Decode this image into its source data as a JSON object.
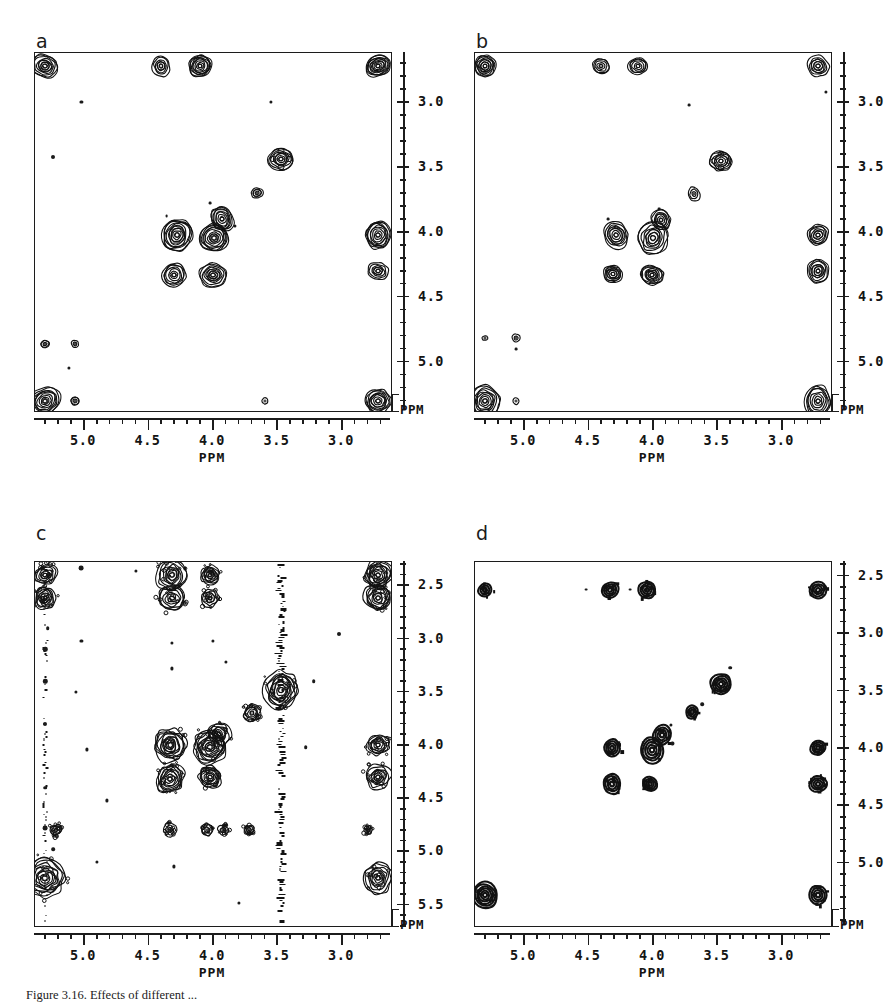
{
  "figure": {
    "caption": "Figure 3.16.  Effects of different ...",
    "axis_unit": "PPM"
  },
  "chart_data": [
    {
      "id": "a",
      "type": "heatmap",
      "subtype": "2D NMR contour spectrum",
      "label": "a",
      "title": "",
      "xlabel": "PPM",
      "ylabel": "PPM",
      "xlim": [
        5.38,
        2.62
      ],
      "ylim": [
        2.62,
        5.38
      ],
      "x_reversed": true,
      "y_reversed": true,
      "grid": false,
      "legend": "none",
      "xticks": [
        5.0,
        4.5,
        4.0,
        3.5,
        3.0
      ],
      "xticklabels": [
        "5.0",
        "4.5",
        "4.0",
        "3.5",
        "3.0"
      ],
      "yticks": [
        3.0,
        3.5,
        4.0,
        4.5,
        5.0
      ],
      "yticklabels": [
        "3.0",
        "3.5",
        "4.0",
        "4.5",
        "5.0"
      ],
      "minor_tick_subdivisions": 5,
      "peaks": [
        {
          "x": 5.3,
          "y": 2.72,
          "r": 13,
          "rings": 6,
          "style": "blob"
        },
        {
          "x": 4.4,
          "y": 2.72,
          "r": 9,
          "rings": 5,
          "style": "blob"
        },
        {
          "x": 4.1,
          "y": 2.72,
          "r": 11,
          "rings": 6,
          "style": "blob"
        },
        {
          "x": 2.72,
          "y": 2.72,
          "r": 12,
          "rings": 6,
          "style": "blob"
        },
        {
          "x": 3.47,
          "y": 3.44,
          "r": 12,
          "rings": 6,
          "style": "star"
        },
        {
          "x": 3.66,
          "y": 3.7,
          "r": 6,
          "rings": 3,
          "style": "blob"
        },
        {
          "x": 3.93,
          "y": 3.9,
          "r": 10,
          "rings": 5,
          "style": "blob"
        },
        {
          "x": 4.28,
          "y": 4.02,
          "r": 14,
          "rings": 7,
          "style": "blob"
        },
        {
          "x": 3.99,
          "y": 4.05,
          "r": 15,
          "rings": 7,
          "style": "blob"
        },
        {
          "x": 4.3,
          "y": 4.33,
          "r": 12,
          "rings": 6,
          "style": "blob"
        },
        {
          "x": 4.0,
          "y": 4.33,
          "r": 13,
          "rings": 6,
          "style": "blob"
        },
        {
          "x": 2.72,
          "y": 4.02,
          "r": 12,
          "rings": 6,
          "style": "blob"
        },
        {
          "x": 2.72,
          "y": 4.3,
          "r": 11,
          "rings": 5,
          "style": "blob"
        },
        {
          "x": 5.3,
          "y": 5.3,
          "r": 15,
          "rings": 7,
          "style": "blob"
        },
        {
          "x": 2.72,
          "y": 5.3,
          "r": 13,
          "rings": 6,
          "style": "blob"
        },
        {
          "x": 5.3,
          "y": 4.86,
          "r": 4,
          "rings": 2,
          "style": "blob"
        },
        {
          "x": 5.07,
          "y": 4.86,
          "r": 4,
          "rings": 2,
          "style": "blob"
        },
        {
          "x": 5.07,
          "y": 5.3,
          "r": 4,
          "rings": 2,
          "style": "blob"
        },
        {
          "x": 3.6,
          "y": 5.3,
          "r": 3,
          "rings": 1,
          "style": "blob"
        }
      ],
      "specks": [
        {
          "x": 5.24,
          "y": 3.42,
          "s": 2
        },
        {
          "x": 5.02,
          "y": 3.0,
          "s": 1.6
        },
        {
          "x": 3.83,
          "y": 3.95,
          "s": 1.6
        },
        {
          "x": 3.55,
          "y": 3.0,
          "s": 1.6
        },
        {
          "x": 4.02,
          "y": 3.78,
          "s": 1.4
        },
        {
          "x": 5.12,
          "y": 5.05,
          "s": 1.6
        },
        {
          "x": 4.36,
          "y": 3.88,
          "s": 1.4
        }
      ],
      "streaks": []
    },
    {
      "id": "b",
      "type": "heatmap",
      "subtype": "2D NMR contour spectrum",
      "label": "b",
      "title": "",
      "xlabel": "PPM",
      "ylabel": "PPM",
      "xlim": [
        5.38,
        2.62
      ],
      "ylim": [
        2.62,
        5.38
      ],
      "x_reversed": true,
      "y_reversed": true,
      "grid": false,
      "legend": "none",
      "xticks": [
        5.0,
        4.5,
        4.0,
        3.5,
        3.0
      ],
      "xticklabels": [
        "5.0",
        "4.5",
        "4.0",
        "3.5",
        "3.0"
      ],
      "yticks": [
        3.0,
        3.5,
        4.0,
        4.5,
        5.0
      ],
      "yticklabels": [
        "3.0",
        "3.5",
        "4.0",
        "4.5",
        "5.0"
      ],
      "minor_tick_subdivisions": 5,
      "peaks": [
        {
          "x": 5.3,
          "y": 2.72,
          "r": 10,
          "rings": 5,
          "style": "blob"
        },
        {
          "x": 4.4,
          "y": 2.72,
          "r": 8,
          "rings": 4,
          "style": "blob"
        },
        {
          "x": 4.12,
          "y": 2.72,
          "r": 10,
          "rings": 5,
          "style": "blob"
        },
        {
          "x": 2.72,
          "y": 2.72,
          "r": 11,
          "rings": 5,
          "style": "blob"
        },
        {
          "x": 3.47,
          "y": 3.45,
          "r": 11,
          "rings": 5,
          "style": "star"
        },
        {
          "x": 3.68,
          "y": 3.71,
          "r": 6,
          "rings": 3,
          "style": "blob"
        },
        {
          "x": 3.94,
          "y": 3.91,
          "r": 9,
          "rings": 5,
          "style": "blob"
        },
        {
          "x": 4.29,
          "y": 4.02,
          "r": 12,
          "rings": 6,
          "style": "blob"
        },
        {
          "x": 4.0,
          "y": 4.05,
          "r": 14,
          "rings": 6,
          "style": "blob"
        },
        {
          "x": 4.31,
          "y": 4.32,
          "r": 10,
          "rings": 5,
          "style": "blob"
        },
        {
          "x": 4.01,
          "y": 4.33,
          "r": 12,
          "rings": 6,
          "style": "blob"
        },
        {
          "x": 2.72,
          "y": 4.02,
          "r": 11,
          "rings": 5,
          "style": "blob"
        },
        {
          "x": 2.72,
          "y": 4.3,
          "r": 10,
          "rings": 5,
          "style": "blob"
        },
        {
          "x": 5.3,
          "y": 5.3,
          "r": 14,
          "rings": 7,
          "style": "blob"
        },
        {
          "x": 2.72,
          "y": 5.3,
          "r": 12,
          "rings": 6,
          "style": "blob"
        },
        {
          "x": 5.3,
          "y": 4.82,
          "r": 3,
          "rings": 1,
          "style": "blob"
        },
        {
          "x": 5.06,
          "y": 4.82,
          "r": 4,
          "rings": 2,
          "style": "blob"
        },
        {
          "x": 5.06,
          "y": 5.3,
          "r": 3,
          "rings": 1,
          "style": "blob"
        }
      ],
      "specks": [
        {
          "x": 2.66,
          "y": 2.92,
          "s": 1.6
        },
        {
          "x": 3.72,
          "y": 3.02,
          "s": 1.4
        },
        {
          "x": 3.95,
          "y": 3.82,
          "s": 1.4
        },
        {
          "x": 4.35,
          "y": 3.9,
          "s": 1.4
        },
        {
          "x": 5.06,
          "y": 4.9,
          "s": 1.4
        }
      ],
      "streaks": []
    },
    {
      "id": "c",
      "type": "heatmap",
      "subtype": "2D NMR contour spectrum with t1-noise",
      "label": "c",
      "title": "",
      "xlabel": "PPM",
      "ylabel": "PPM",
      "xlim": [
        5.38,
        2.62
      ],
      "ylim": [
        2.28,
        5.7
      ],
      "x_reversed": true,
      "y_reversed": true,
      "grid": false,
      "legend": "none",
      "xticks": [
        5.0,
        4.5,
        4.0,
        3.5,
        3.0
      ],
      "xticklabels": [
        "5.0",
        "4.5",
        "4.0",
        "3.5",
        "3.0"
      ],
      "yticks": [
        2.5,
        3.0,
        3.5,
        4.0,
        4.5,
        5.0,
        5.5
      ],
      "yticklabels": [
        "2.5",
        "3.0",
        "3.5",
        "4.0",
        "4.5",
        "5.0",
        "5.5"
      ],
      "minor_tick_subdivisions": 5,
      "peaks": [
        {
          "x": 5.3,
          "y": 2.4,
          "r": 11,
          "rings": 5,
          "style": "noisy"
        },
        {
          "x": 4.32,
          "y": 2.4,
          "r": 14,
          "rings": 6,
          "style": "noisy"
        },
        {
          "x": 4.02,
          "y": 2.4,
          "r": 9,
          "rings": 5,
          "style": "noisy"
        },
        {
          "x": 2.72,
          "y": 2.4,
          "r": 13,
          "rings": 6,
          "style": "noisy"
        },
        {
          "x": 5.3,
          "y": 2.62,
          "r": 10,
          "rings": 5,
          "style": "noisy"
        },
        {
          "x": 4.32,
          "y": 2.62,
          "r": 13,
          "rings": 6,
          "style": "noisy"
        },
        {
          "x": 4.02,
          "y": 2.62,
          "r": 9,
          "rings": 4,
          "style": "noisy"
        },
        {
          "x": 2.72,
          "y": 2.62,
          "r": 13,
          "rings": 6,
          "style": "noisy"
        },
        {
          "x": 3.47,
          "y": 3.48,
          "r": 16,
          "rings": 7,
          "style": "noisy"
        },
        {
          "x": 3.7,
          "y": 3.7,
          "r": 8,
          "rings": 4,
          "style": "noisy"
        },
        {
          "x": 3.95,
          "y": 3.9,
          "r": 10,
          "rings": 5,
          "style": "noisy"
        },
        {
          "x": 4.33,
          "y": 4.0,
          "r": 17,
          "rings": 8,
          "style": "noisy"
        },
        {
          "x": 4.02,
          "y": 4.02,
          "r": 16,
          "rings": 7,
          "style": "noisy"
        },
        {
          "x": 4.33,
          "y": 4.32,
          "r": 12,
          "rings": 6,
          "style": "noisy"
        },
        {
          "x": 4.02,
          "y": 4.3,
          "r": 12,
          "rings": 6,
          "style": "noisy"
        },
        {
          "x": 2.72,
          "y": 4.0,
          "r": 11,
          "rings": 5,
          "style": "noisy"
        },
        {
          "x": 2.72,
          "y": 4.3,
          "r": 13,
          "rings": 6,
          "style": "noisy"
        },
        {
          "x": 5.3,
          "y": 5.25,
          "r": 18,
          "rings": 8,
          "style": "noisy"
        },
        {
          "x": 2.72,
          "y": 5.25,
          "r": 13,
          "rings": 6,
          "style": "noisy"
        },
        {
          "x": 5.22,
          "y": 4.8,
          "r": 6,
          "rings": 3,
          "style": "noisy"
        },
        {
          "x": 4.33,
          "y": 4.8,
          "r": 6,
          "rings": 3,
          "style": "noisy"
        },
        {
          "x": 4.05,
          "y": 4.8,
          "r": 5,
          "rings": 2,
          "style": "noisy"
        },
        {
          "x": 3.92,
          "y": 4.8,
          "r": 5,
          "rings": 2,
          "style": "noisy"
        },
        {
          "x": 3.72,
          "y": 4.8,
          "r": 5,
          "rings": 2,
          "style": "noisy"
        },
        {
          "x": 2.8,
          "y": 4.8,
          "r": 4,
          "rings": 2,
          "style": "noisy"
        }
      ],
      "specks": [
        {
          "x": 5.32,
          "y": 2.34,
          "s": 2
        },
        {
          "x": 5.02,
          "y": 2.34,
          "s": 2.4
        },
        {
          "x": 4.6,
          "y": 2.36,
          "s": 1.6
        },
        {
          "x": 4.22,
          "y": 2.34,
          "s": 1.6
        },
        {
          "x": 5.28,
          "y": 2.9,
          "s": 1.8
        },
        {
          "x": 5.3,
          "y": 3.1,
          "s": 2.2
        },
        {
          "x": 5.3,
          "y": 3.4,
          "s": 2.2
        },
        {
          "x": 5.3,
          "y": 3.8,
          "s": 2.0
        },
        {
          "x": 5.3,
          "y": 4.4,
          "s": 1.8
        },
        {
          "x": 5.3,
          "y": 4.78,
          "s": 2.4
        },
        {
          "x": 5.24,
          "y": 4.98,
          "s": 1.8
        },
        {
          "x": 3.02,
          "y": 2.96,
          "s": 2.0
        },
        {
          "x": 4.32,
          "y": 3.04,
          "s": 1.6
        },
        {
          "x": 4.32,
          "y": 3.28,
          "s": 1.6
        },
        {
          "x": 4.0,
          "y": 3.02,
          "s": 1.6
        },
        {
          "x": 3.9,
          "y": 3.22,
          "s": 1.6
        },
        {
          "x": 5.02,
          "y": 3.02,
          "s": 1.6
        },
        {
          "x": 5.06,
          "y": 3.5,
          "s": 1.6
        },
        {
          "x": 4.98,
          "y": 4.04,
          "s": 1.6
        },
        {
          "x": 4.82,
          "y": 4.52,
          "s": 1.6
        },
        {
          "x": 4.9,
          "y": 5.1,
          "s": 1.6
        },
        {
          "x": 4.3,
          "y": 5.14,
          "s": 1.6
        },
        {
          "x": 3.8,
          "y": 5.48,
          "s": 1.6
        },
        {
          "x": 3.28,
          "y": 4.02,
          "s": 1.8
        },
        {
          "x": 3.22,
          "y": 3.4,
          "s": 1.8
        }
      ],
      "streaks": [
        {
          "x": 3.47,
          "y0": 2.3,
          "y1": 5.66,
          "w": 7,
          "intensity": "strong",
          "note": "t1-noise ridge"
        },
        {
          "x": 5.3,
          "y0": 2.3,
          "y1": 5.66,
          "w": 5,
          "intensity": "weak",
          "note": "t1-noise ridge"
        }
      ]
    },
    {
      "id": "d",
      "type": "heatmap",
      "subtype": "2D NMR contour spectrum",
      "label": "d",
      "title": "",
      "xlabel": "PPM",
      "ylabel": "PPM",
      "xlim": [
        5.38,
        2.62
      ],
      "ylim": [
        2.38,
        5.55
      ],
      "x_reversed": true,
      "y_reversed": true,
      "grid": false,
      "legend": "none",
      "xticks": [
        5.0,
        4.5,
        4.0,
        3.5,
        3.0
      ],
      "xticklabels": [
        "5.0",
        "4.5",
        "4.0",
        "3.5",
        "3.0"
      ],
      "yticks": [
        2.5,
        3.0,
        3.5,
        4.0,
        4.5,
        5.0
      ],
      "yticklabels": [
        "2.5",
        "3.0",
        "3.5",
        "4.0",
        "4.5",
        "5.0"
      ],
      "minor_tick_subdivisions": 5,
      "peaks": [
        {
          "x": 5.3,
          "y": 2.62,
          "r": 7,
          "rings": 3,
          "style": "pixel"
        },
        {
          "x": 4.33,
          "y": 2.62,
          "r": 9,
          "rings": 4,
          "style": "pixel"
        },
        {
          "x": 4.05,
          "y": 2.62,
          "r": 9,
          "rings": 4,
          "style": "pixel"
        },
        {
          "x": 2.72,
          "y": 2.62,
          "r": 9,
          "rings": 4,
          "style": "pixel"
        },
        {
          "x": 3.47,
          "y": 3.44,
          "r": 11,
          "rings": 5,
          "style": "pixel"
        },
        {
          "x": 3.7,
          "y": 3.69,
          "r": 6,
          "rings": 3,
          "style": "pixel"
        },
        {
          "x": 3.93,
          "y": 3.89,
          "r": 9,
          "rings": 4,
          "style": "pixel"
        },
        {
          "x": 4.32,
          "y": 4.0,
          "r": 8,
          "rings": 4,
          "style": "pixel"
        },
        {
          "x": 4.01,
          "y": 4.02,
          "r": 12,
          "rings": 5,
          "style": "pixel"
        },
        {
          "x": 4.32,
          "y": 4.31,
          "r": 9,
          "rings": 4,
          "style": "pixel"
        },
        {
          "x": 4.02,
          "y": 4.31,
          "r": 8,
          "rings": 4,
          "style": "pixel"
        },
        {
          "x": 2.72,
          "y": 4.0,
          "r": 8,
          "rings": 4,
          "style": "pixel"
        },
        {
          "x": 2.72,
          "y": 4.31,
          "r": 9,
          "rings": 4,
          "style": "pixel"
        },
        {
          "x": 5.3,
          "y": 5.28,
          "r": 13,
          "rings": 6,
          "style": "pixel"
        },
        {
          "x": 2.72,
          "y": 5.28,
          "r": 9,
          "rings": 4,
          "style": "pixel"
        }
      ],
      "specks": [
        {
          "x": 3.4,
          "y": 3.3,
          "s": 1.8
        },
        {
          "x": 3.62,
          "y": 3.62,
          "s": 1.8
        },
        {
          "x": 3.86,
          "y": 3.8,
          "s": 1.6
        },
        {
          "x": 3.85,
          "y": 3.96,
          "s": 1.6
        },
        {
          "x": 4.52,
          "y": 2.62,
          "s": 1.4
        },
        {
          "x": 4.18,
          "y": 2.62,
          "s": 1.4
        }
      ],
      "streaks": []
    }
  ]
}
